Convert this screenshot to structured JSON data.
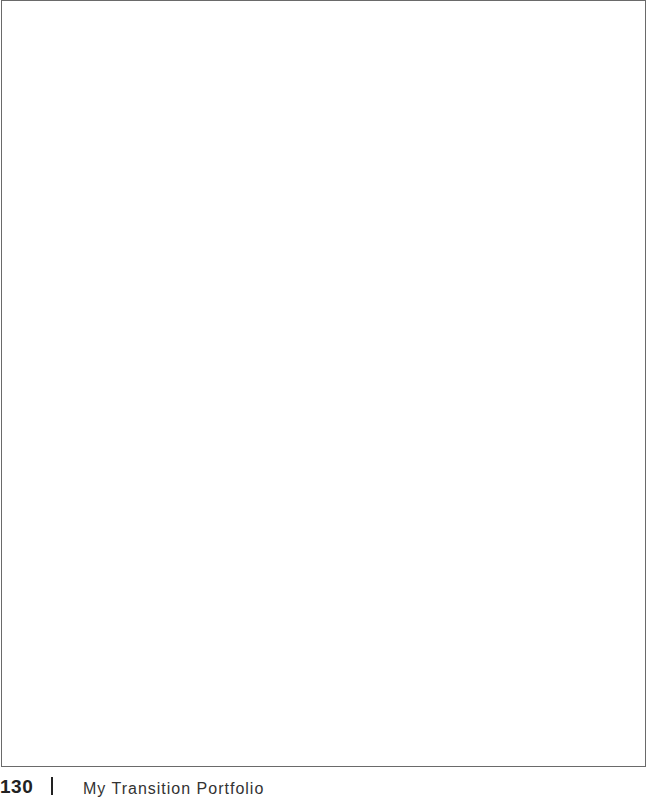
{
  "page": {
    "frame": {
      "content": "",
      "border_color": "#6a6a6a"
    },
    "footer": {
      "page_number": "130",
      "separator": "|",
      "title": "My Transition Portfolio"
    }
  }
}
